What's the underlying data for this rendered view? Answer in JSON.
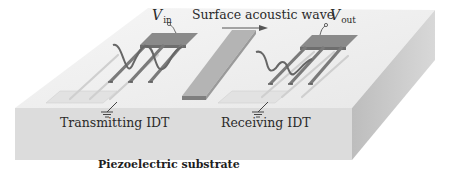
{
  "diagram": {
    "labels": {
      "wave": "Surface acoustic wave",
      "transmitter": "Transmitting IDT",
      "receiver": "Receiving IDT",
      "substrate": "Piezoelectric substrate",
      "v_in_symbol": "V",
      "v_in_sub": "in",
      "v_out_symbol": "V",
      "v_out_sub": "out"
    },
    "colors": {
      "substrate_top": "#efefef",
      "substrate_front": "#dcdcdc",
      "substrate_side": "#c6c6c6",
      "electrode": "#8a8a8a",
      "electrode_dark": "#6e6e6e",
      "wave": "#6a6a6a",
      "text": "#2a2a2a"
    },
    "elements": [
      {
        "name": "transmitting-idt",
        "role": "converts input voltage into surface acoustic wave",
        "fingers": 3
      },
      {
        "name": "absorber-block",
        "role": "bar between transducers"
      },
      {
        "name": "receiving-idt",
        "role": "converts surface acoustic wave into output voltage",
        "fingers": 3
      },
      {
        "name": "ground",
        "count": 2
      }
    ]
  }
}
